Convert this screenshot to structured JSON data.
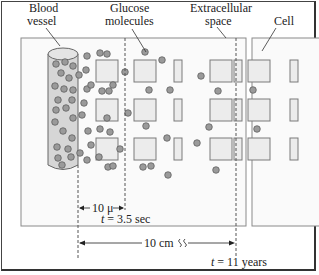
{
  "labels": {
    "blood_vessel_line1": "Blood",
    "blood_vessel_line2": "vessel",
    "glucose_line1": "Glucose",
    "glucose_line2": "molecules",
    "extracellular_line1": "Extracellular",
    "extracellular_line2": "space",
    "cell": "Cell"
  },
  "measurements": {
    "short_distance": "10 μ",
    "short_time_var": "t",
    "short_time_value": " = 3.5 sec",
    "long_distance": "10 cm",
    "long_time_var": "t",
    "long_time_value": " = 11 years"
  },
  "colors": {
    "tissue_fill": "#fafafa",
    "tissue_stroke": "#8a8a8a",
    "cell_fill": "#ececec",
    "cell_stroke": "#7a7a7a",
    "vessel_fill": "#d6d6d6",
    "vessel_stroke": "#666666",
    "molecule_fill": "#9a9a9a",
    "molecule_stroke": "#555555"
  }
}
